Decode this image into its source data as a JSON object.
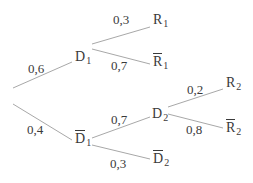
{
  "diagram": {
    "type": "probability-tree",
    "colors": {
      "line": "#a8a8a8",
      "text": "#3a3a3a",
      "background": "#ffffff"
    },
    "nodes": {
      "D1": {
        "letter": "D",
        "sub": "1",
        "bar": false
      },
      "D1bar": {
        "letter": "D",
        "sub": "1",
        "bar": true
      },
      "R1": {
        "letter": "R",
        "sub": "1",
        "bar": false
      },
      "R1bar": {
        "letter": "R",
        "sub": "1",
        "bar": true
      },
      "D2": {
        "letter": "D",
        "sub": "2",
        "bar": false
      },
      "D2bar": {
        "letter": "D",
        "sub": "2",
        "bar": true
      },
      "R2": {
        "letter": "R",
        "sub": "2",
        "bar": false
      },
      "R2bar": {
        "letter": "R",
        "sub": "2",
        "bar": true
      }
    },
    "edges": {
      "root_D1": {
        "prob": "0,6"
      },
      "root_D1bar": {
        "prob": "0,4"
      },
      "D1_R1": {
        "prob": "0,3"
      },
      "D1_R1bar": {
        "prob": "0,7"
      },
      "D1bar_D2": {
        "prob": "0,7"
      },
      "D1bar_D2bar": {
        "prob": "0,3"
      },
      "D2_R2": {
        "prob": "0,2"
      },
      "D2_R2bar": {
        "prob": "0,8"
      }
    }
  }
}
